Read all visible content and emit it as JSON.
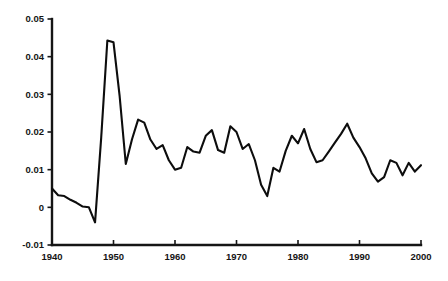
{
  "chart_data": {
    "type": "line",
    "title": "",
    "subtitle": "",
    "xlabel": "",
    "ylabel": "",
    "xlim": [
      1940,
      2000
    ],
    "ylim": [
      -0.01,
      0.05
    ],
    "grid": false,
    "legend": null,
    "legend_position": "none",
    "annotations": [],
    "xtick_labels": [
      "1940",
      "1950",
      "1960",
      "1970",
      "1980",
      "1990",
      "2000"
    ],
    "xticks": [
      1940,
      1950,
      1960,
      1970,
      1980,
      1990,
      2000
    ],
    "ytick_labels": [
      "0.05",
      "0.04",
      "0.03",
      "0.02",
      "0.01",
      "0",
      "-0.01"
    ],
    "yticks": [
      0.05,
      0.04,
      0.03,
      0.02,
      0.01,
      0,
      -0.01
    ],
    "line_color": "#0d0d0d",
    "axis_color": "#151515",
    "background_color": "#ffffff",
    "x": [
      1940,
      1941,
      1942,
      1943,
      1944,
      1945,
      1946,
      1947,
      1948,
      1949,
      1950,
      1951,
      1952,
      1953,
      1954,
      1955,
      1956,
      1957,
      1958,
      1959,
      1960,
      1961,
      1962,
      1963,
      1964,
      1965,
      1966,
      1967,
      1968,
      1969,
      1970,
      1971,
      1972,
      1973,
      1974,
      1975,
      1976,
      1977,
      1978,
      1979,
      1980,
      1981,
      1982,
      1983,
      1984,
      1985,
      1986,
      1987,
      1988,
      1989,
      1990,
      1991,
      1992,
      1993,
      1994,
      1995,
      1996,
      1997,
      1998,
      1999,
      2000
    ],
    "values": [
      0.005,
      0.0032,
      0.003,
      0.002,
      0.0012,
      0.0002,
      0.0,
      -0.004,
      0.0185,
      0.0443,
      0.0438,
      0.0295,
      0.0115,
      0.018,
      0.0233,
      0.0225,
      0.018,
      0.0155,
      0.0165,
      0.0125,
      0.01,
      0.0105,
      0.016,
      0.0148,
      0.0145,
      0.019,
      0.0205,
      0.0152,
      0.0145,
      0.0215,
      0.02,
      0.0155,
      0.0168,
      0.0125,
      0.006,
      0.003,
      0.0105,
      0.0095,
      0.015,
      0.019,
      0.017,
      0.0208,
      0.0155,
      0.012,
      0.0125,
      0.0148,
      0.0172,
      0.0195,
      0.0222,
      0.0185,
      0.016,
      0.013,
      0.009,
      0.0068,
      0.008,
      0.0125,
      0.0118,
      0.0085,
      0.0118,
      0.0095,
      0.0112
    ]
  }
}
